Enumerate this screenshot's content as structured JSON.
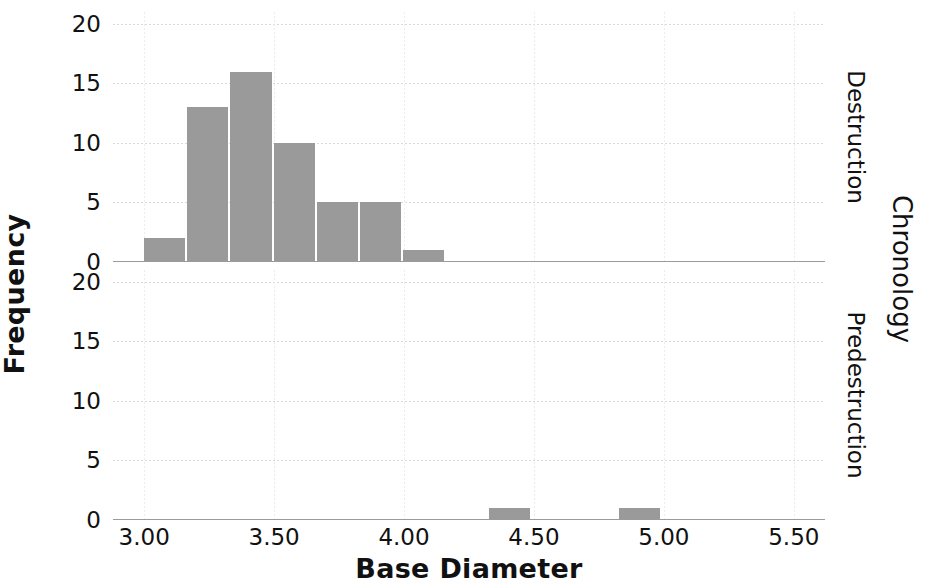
{
  "chart_data": {
    "type": "bar",
    "title": "",
    "xlabel": "Base Diameter",
    "ylabel": "Frequency",
    "right_axis_title": "Chronology",
    "grid": true,
    "legend": "none",
    "xlim": [
      2.88,
      5.62
    ],
    "ylim": [
      0,
      21
    ],
    "xticks": [
      "3.00",
      "3.50",
      "4.00",
      "4.50",
      "5.00",
      "5.50"
    ],
    "xtick_values": [
      3.0,
      3.5,
      4.0,
      4.5,
      5.0,
      5.5
    ],
    "yticks": [
      "0",
      "5",
      "10",
      "15",
      "20"
    ],
    "ytick_values": [
      0,
      5,
      10,
      15,
      20
    ],
    "bin_width": 0.166,
    "bar_color": "#9a9a9a",
    "facets": [
      {
        "label": "Destruction",
        "bin_starts": [
          3.0,
          3.166,
          3.332,
          3.498,
          3.664,
          3.83,
          3.996
        ],
        "values": [
          2,
          13,
          16,
          10,
          5,
          5,
          1
        ]
      },
      {
        "label": "Predestruction",
        "bin_starts": [
          4.328,
          4.826
        ],
        "values": [
          1,
          1
        ]
      }
    ]
  }
}
